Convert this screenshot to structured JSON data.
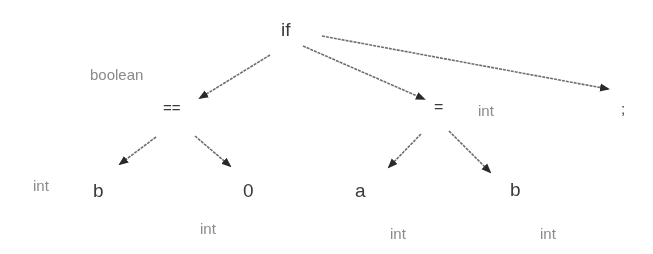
{
  "diagram": {
    "kind": "annotated syntax tree",
    "edge_color": "#6e6e6e",
    "node_color": "#3a3a3a",
    "type_color": "#8a8a8a",
    "nodes": [
      {
        "id": "if",
        "label": "if"
      },
      {
        "id": "eq",
        "label": "==",
        "type": "boolean"
      },
      {
        "id": "assign",
        "label": "=",
        "type": "int"
      },
      {
        "id": "semi",
        "label": ";"
      },
      {
        "id": "b1",
        "label": "b",
        "type": "int"
      },
      {
        "id": "zero",
        "label": "0",
        "type": "int"
      },
      {
        "id": "a",
        "label": "a",
        "type": "int"
      },
      {
        "id": "b2",
        "label": "b",
        "type": "int"
      }
    ],
    "edges": [
      {
        "from": "if",
        "to": "eq"
      },
      {
        "from": "if",
        "to": "assign"
      },
      {
        "from": "if",
        "to": "semi"
      },
      {
        "from": "eq",
        "to": "b1"
      },
      {
        "from": "eq",
        "to": "zero"
      },
      {
        "from": "assign",
        "to": "a"
      },
      {
        "from": "assign",
        "to": "b2"
      }
    ]
  }
}
